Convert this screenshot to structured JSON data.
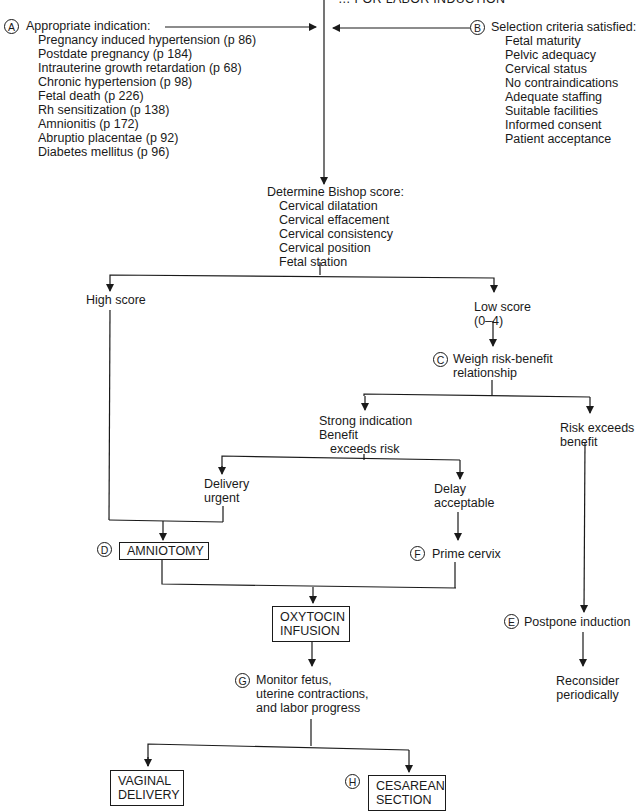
{
  "title": "… FOR LABOR INDUCTION",
  "nodes": {
    "A": {
      "badge": "A",
      "heading": "Appropriate indication:",
      "items": [
        "Pregnancy induced hypertension (p 86)",
        "Postdate pregnancy (p 184)",
        "Intrauterine growth retardation (p 68)",
        "Chronic hypertension (p 98)",
        "Fetal death (p 226)",
        "Rh sensitization (p 138)",
        "Amnionitis (p 172)",
        "Abruptio placentae (p 92)",
        "Diabetes mellitus (p 96)"
      ]
    },
    "B": {
      "badge": "B",
      "heading": "Selection criteria satisfied:",
      "items": [
        "Fetal maturity",
        "Pelvic adequacy",
        "Cervical status",
        "No contraindications",
        "Adequate staffing",
        "Suitable facilities",
        "Informed consent",
        "Patient acceptance"
      ]
    },
    "bishop": {
      "heading": "Determine Bishop score:",
      "items": [
        "Cervical dilatation",
        "Cervical effacement",
        "Cervical consistency",
        "Cervical position",
        "Fetal station"
      ]
    },
    "high_score": "High score",
    "low_score": {
      "line1": "Low score",
      "line2": "(0–4)"
    },
    "C": {
      "badge": "C",
      "line1": "Weigh risk-benefit",
      "line2": "relationship"
    },
    "strong": {
      "line1": "Strong indication",
      "line2": "Benefit",
      "line3": "exceeds risk"
    },
    "risk_exceeds": {
      "line1": "Risk exceeds",
      "line2": "benefit"
    },
    "delivery_urgent": {
      "line1": "Delivery",
      "line2": "urgent"
    },
    "delay_acceptable": {
      "line1": "Delay",
      "line2": "acceptable"
    },
    "D": {
      "badge": "D",
      "label": "AMNIOTOMY"
    },
    "F": {
      "badge": "F",
      "label": "Prime cervix"
    },
    "oxytocin": {
      "line1": "OXYTOCIN",
      "line2": "INFUSION"
    },
    "E": {
      "badge": "E",
      "label": "Postpone induction"
    },
    "reconsider": {
      "line1": "Reconsider",
      "line2": "periodically"
    },
    "G": {
      "badge": "G",
      "line1": "Monitor fetus,",
      "line2": "uterine contractions,",
      "line3": "and labor progress"
    },
    "vaginal": {
      "line1": "VAGINAL",
      "line2": "DELIVERY"
    },
    "H": {
      "badge": "H",
      "line1": "CESAREAN",
      "line2": "SECTION"
    }
  },
  "colors": {
    "ink": "#1a1a1a",
    "background": "#ffffff"
  }
}
